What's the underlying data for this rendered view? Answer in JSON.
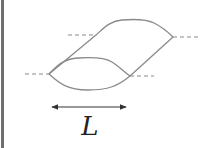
{
  "diagram": {
    "length_label": "L",
    "colors": {
      "stroke": "#8a8a8a",
      "dashed": "#8a8a8a",
      "arrow": "#333333",
      "border": "#6e6e6e",
      "background": "#ffffff"
    }
  }
}
